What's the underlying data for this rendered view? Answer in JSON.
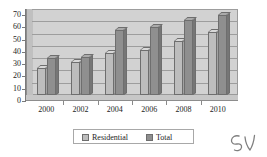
{
  "chart_data": {
    "type": "bar",
    "title": "",
    "subtitle": "",
    "xlabel": "",
    "ylabel": "",
    "categories": [
      "2000",
      "2002",
      "2004",
      "2006",
      "2008",
      "2010"
    ],
    "series": [
      {
        "name": "Residential",
        "values": [
          22,
          27,
          34,
          37,
          44,
          51
        ],
        "color": "#bdbdbd"
      },
      {
        "name": "Total",
        "values": [
          30,
          31,
          53,
          55,
          61,
          65
        ],
        "color": "#8f8f8f"
      }
    ],
    "ylim": [
      0,
      70
    ],
    "ytick_step": 10,
    "yticks": [
      "0",
      "10",
      "20",
      "30",
      "40",
      "50",
      "60",
      "70"
    ],
    "grid": true,
    "grid_axis": "y",
    "legend_position": "bottom",
    "style": "3d-clustered-column",
    "plot_background": "#d2d2d2"
  },
  "legend": {
    "items": [
      {
        "label": "Residential",
        "swatch": "#bdbdbd"
      },
      {
        "label": "Total",
        "swatch": "#8f8f8f"
      }
    ]
  },
  "annotation": {
    "handwriting_mark": "5v"
  }
}
